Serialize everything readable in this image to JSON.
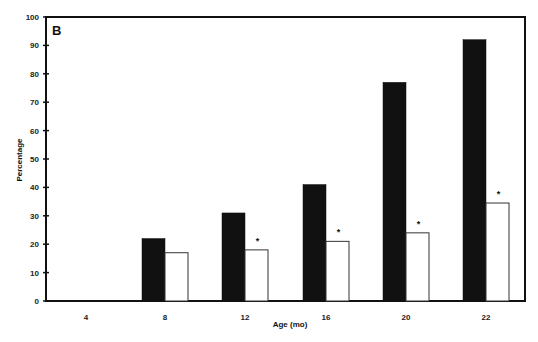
{
  "chart_data": {
    "type": "bar",
    "title": "",
    "panel_label": "B",
    "xlabel": "Age (mo)",
    "ylabel": "Percentage",
    "ylim": [
      0,
      100
    ],
    "yticks": [
      0,
      10,
      20,
      30,
      40,
      50,
      60,
      70,
      80,
      90,
      100
    ],
    "categories": [
      "4",
      "8",
      "12",
      "16",
      "20",
      "22"
    ],
    "series": [
      {
        "name": "Group 1 (black)",
        "color": "#111111",
        "values": [
          0,
          22,
          31,
          41,
          77,
          92
        ]
      },
      {
        "name": "Group 2 (white)",
        "color": "#ffffff",
        "values": [
          0,
          17,
          18,
          21,
          24,
          34.5
        ]
      }
    ],
    "annotations": [
      {
        "category": "12",
        "series": 1,
        "text": "*"
      },
      {
        "category": "16",
        "series": 1,
        "text": "*"
      },
      {
        "category": "20",
        "series": 1,
        "text": "*"
      },
      {
        "category": "22",
        "series": 1,
        "text": "*"
      }
    ],
    "grid": false,
    "legend": "none"
  }
}
